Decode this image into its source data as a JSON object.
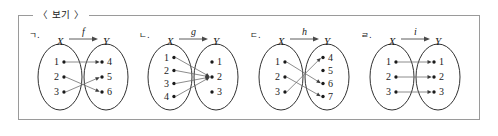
{
  "frame": {
    "legend": "〈 보기 〉"
  },
  "panels": [
    {
      "marker": "ㄱ.",
      "function_label": "f",
      "domain_label": "X",
      "codomain_label": "Y",
      "domain_elements": [
        "1",
        "2",
        "3"
      ],
      "codomain_elements": [
        "4",
        "5",
        "6"
      ],
      "mappings": [
        {
          "from": "1",
          "to": "4"
        },
        {
          "from": "2",
          "to": "6"
        },
        {
          "from": "3",
          "to": "5"
        }
      ]
    },
    {
      "marker": "ㄴ.",
      "function_label": "g",
      "domain_label": "X",
      "codomain_label": "Y",
      "domain_elements": [
        "1",
        "2",
        "3",
        "4"
      ],
      "codomain_elements": [
        "1",
        "2",
        "3"
      ],
      "mappings": [
        {
          "from": "1",
          "to": "2"
        },
        {
          "from": "2",
          "to": "2"
        },
        {
          "from": "3",
          "to": "2"
        },
        {
          "from": "4",
          "to": "2"
        }
      ]
    },
    {
      "marker": "ㄷ.",
      "function_label": "h",
      "domain_label": "X",
      "codomain_label": "Y",
      "domain_elements": [
        "1",
        "2",
        "3"
      ],
      "codomain_elements": [
        "4",
        "5",
        "6",
        "7"
      ],
      "mappings": [
        {
          "from": "1",
          "to": "6"
        },
        {
          "from": "2",
          "to": "7"
        },
        {
          "from": "3",
          "to": "4"
        }
      ]
    },
    {
      "marker": "ㄹ.",
      "function_label": "i",
      "domain_label": "X",
      "codomain_label": "Y",
      "domain_elements": [
        "1",
        "2",
        "3"
      ],
      "codomain_elements": [
        "1",
        "2",
        "3"
      ],
      "mappings": [
        {
          "from": "1",
          "to": "1"
        },
        {
          "from": "2",
          "to": "2"
        },
        {
          "from": "3",
          "to": "3"
        }
      ]
    }
  ],
  "colors": {
    "frame_border": "#9a9a9a",
    "ellipse_stroke": "#1a1a1a",
    "map_line": "#6e6e6e",
    "text": "#1a1a1a",
    "background": "#ffffff"
  }
}
